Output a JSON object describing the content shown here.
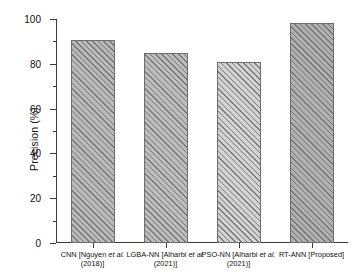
{
  "chart_data": {
    "type": "bar",
    "title": "",
    "xlabel": "",
    "ylabel": "Precision (%)",
    "ylim": [
      0,
      100
    ],
    "ytick_values": [
      0,
      20,
      40,
      60,
      80,
      100
    ],
    "ytick_labels": [
      "0",
      "20",
      "40",
      "60",
      "80",
      "100"
    ],
    "minor_ytick_values": [
      10,
      30,
      50,
      70,
      90
    ],
    "grid": false,
    "legend": null,
    "categories": [
      "CNN [Nguyen et al. (2018)]",
      "LGBA-NN [Alharbi et al. (2021)]",
      "PSO-NN [Alharbi et al. (2021)]",
      "RT-ANN [Proposed]"
    ],
    "values": [
      90.5,
      84.7,
      81.0,
      98.0
    ],
    "bars": [
      {
        "label_lines": [
          [
            "CNN [Nguyen ",
            "et al.",
            ""
          ],
          [
            "(2018)]"
          ]
        ],
        "name": "CNN [Nguyen et al. (2018)]",
        "value": 90.5,
        "fill": "#b9b9b9"
      },
      {
        "label_lines": [
          [
            "LGBA-NN [Alharbi ",
            "et al.",
            ""
          ],
          [
            "(2021)]"
          ]
        ],
        "name": "LGBA-NN [Alharbi et al. (2021)]",
        "value": 84.7,
        "fill": "#bdbdbd"
      },
      {
        "label_lines": [
          [
            "PSO-NN [Alharbi ",
            "et al.",
            ""
          ],
          [
            "(2021)]"
          ]
        ],
        "name": "PSO-NN [Alharbi et al. (2021)]",
        "value": 81.0,
        "fill": "#d2d2d2"
      },
      {
        "label_lines": [
          [
            "RT-ANN [Proposed]"
          ]
        ],
        "name": "RT-ANN [Proposed]",
        "value": 98.0,
        "fill": "#b0b0b0"
      }
    ],
    "colors": {
      "axis": "#3a3a3a",
      "bar_edge": "#6e6e6e",
      "hatch": "#6e6e6e",
      "background": "#ffffff",
      "text": "#111111"
    }
  }
}
